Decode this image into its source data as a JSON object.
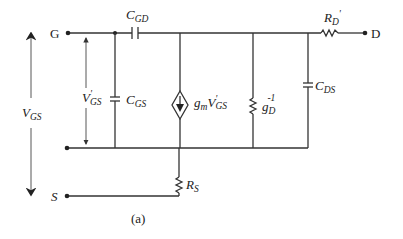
{
  "diagram": {
    "type": "small-signal equivalent circuit",
    "caption": "(a)",
    "terminals": {
      "gate": "G",
      "drain": "D",
      "source": "S"
    },
    "components": [
      {
        "id": "cgd",
        "kind": "capacitor",
        "label": "C",
        "sub": "GD"
      },
      {
        "id": "cgs",
        "kind": "capacitor",
        "label": "C",
        "sub": "GS"
      },
      {
        "id": "gm",
        "kind": "dependent current source",
        "label": "g",
        "sub": "m",
        "ctrl": "V",
        "ctrl_sup": "'",
        "ctrl_sub": "GS"
      },
      {
        "id": "gd",
        "kind": "resistor",
        "label": "g",
        "sub": "D",
        "sup": "-1"
      },
      {
        "id": "cds",
        "kind": "capacitor",
        "label": "C",
        "sub": "DS"
      },
      {
        "id": "rd",
        "kind": "resistor",
        "label": "R",
        "sub": "D",
        "sup": "'"
      },
      {
        "id": "rs",
        "kind": "resistor",
        "label": "R",
        "sub": "S"
      }
    ],
    "voltages": [
      {
        "id": "vgs",
        "label": "V",
        "sub": "GS"
      },
      {
        "id": "vgs_int",
        "label": "V",
        "sup": "'",
        "sub": "GS"
      }
    ]
  }
}
